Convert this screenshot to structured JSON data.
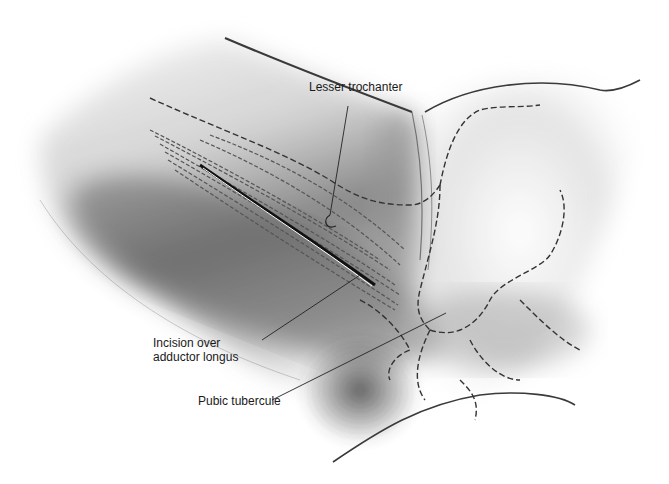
{
  "figure": {
    "labels": [
      {
        "id": "lesser-trochanter",
        "lines": [
          "Lesser trochanter"
        ]
      },
      {
        "id": "incision",
        "lines": [
          "Incision over",
          "adductor longus"
        ]
      },
      {
        "id": "pubic-tubercule",
        "lines": [
          "Pubic tubercule"
        ]
      }
    ]
  }
}
